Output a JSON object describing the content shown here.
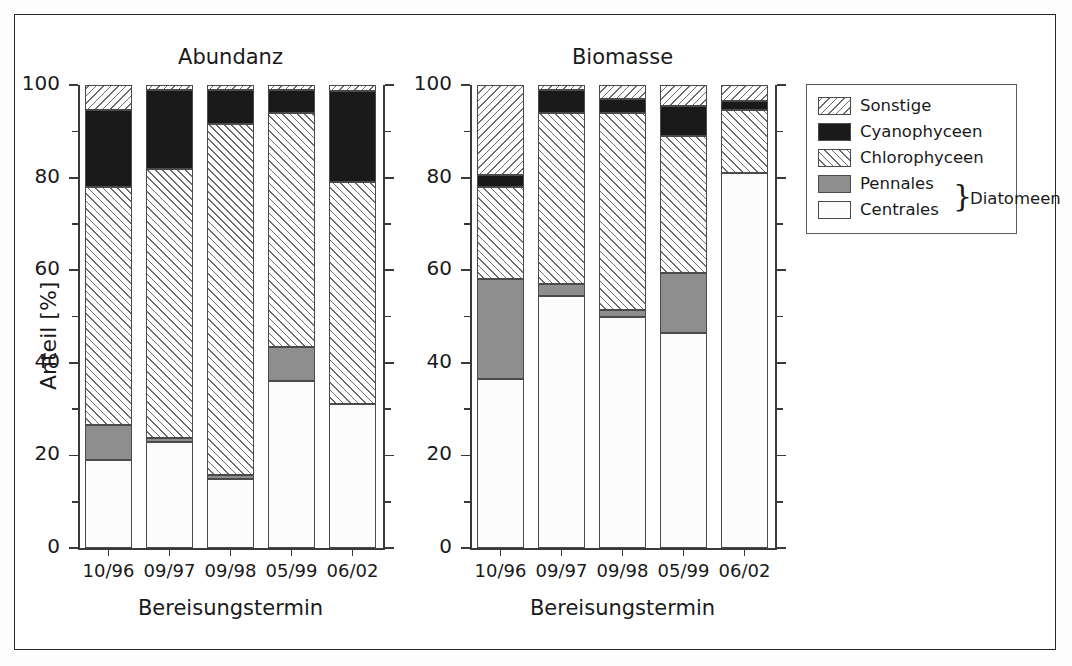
{
  "figure": {
    "width": 1072,
    "height": 666
  },
  "legend": {
    "name": "series-legend",
    "items": [
      {
        "label": "Sonstige",
        "key": "sonstige",
        "pattern": "backslash-hatch",
        "color": "#ffffff"
      },
      {
        "label": "Cyanophyceen",
        "key": "cyano",
        "pattern": "solid",
        "color": "#1a1a1a"
      },
      {
        "label": "Chlorophyceen",
        "key": "chloro",
        "pattern": "forwardslash-hatch",
        "color": "#ffffff"
      },
      {
        "label": "Pennales",
        "key": "pennales",
        "pattern": "solid",
        "color": "#8e8e8e"
      },
      {
        "label": "Centrales",
        "key": "centrales",
        "pattern": "solid",
        "color": "#fcfcfc"
      }
    ],
    "group_label": "Diatomeen",
    "group_brace": "}",
    "group_members": [
      "Pennales",
      "Centrales"
    ]
  },
  "axes": {
    "ylabel": "Anteil [%]",
    "yticks": [
      0,
      20,
      40,
      60,
      80,
      100
    ],
    "ytick_labels": [
      "0",
      "20",
      "40",
      "60",
      "80",
      "100"
    ],
    "yminor_step": 10,
    "ylim": [
      0,
      100
    ],
    "xlabel": "Bereisungstermin"
  },
  "chart_data": [
    {
      "type": "bar",
      "title": "Abundanz",
      "subtitle": "",
      "stacked": true,
      "xlabel": "Bereisungstermin",
      "ylabel": "Anteil [%]",
      "ylim": [
        0,
        100
      ],
      "yticks": [
        0,
        20,
        40,
        60,
        80,
        100
      ],
      "grid": false,
      "legend_position": "right-outside",
      "categories": [
        "10/96",
        "09/97",
        "09/98",
        "05/99",
        "06/02"
      ],
      "series": [
        {
          "name": "Centrales",
          "values": [
            19.0,
            23.0,
            14.8,
            36.0,
            31.0
          ]
        },
        {
          "name": "Pennales",
          "values": [
            7.5,
            0.8,
            0.9,
            7.5,
            0.0
          ]
        },
        {
          "name": "Chlorophyceen",
          "values": [
            51.5,
            58.0,
            75.8,
            50.5,
            48.0
          ]
        },
        {
          "name": "Cyanophyceen",
          "values": [
            16.5,
            17.2,
            7.5,
            5.0,
            19.8
          ]
        },
        {
          "name": "Sonstige",
          "values": [
            5.5,
            1.0,
            1.0,
            1.0,
            1.2
          ]
        }
      ]
    },
    {
      "type": "bar",
      "title": "Biomasse",
      "subtitle": "",
      "stacked": true,
      "xlabel": "Bereisungstermin",
      "ylabel": "Anteil [%]",
      "ylim": [
        0,
        100
      ],
      "yticks": [
        0,
        20,
        40,
        60,
        80,
        100
      ],
      "grid": false,
      "legend_position": "right-outside",
      "categories": [
        "10/96",
        "09/97",
        "09/98",
        "05/99",
        "06/02"
      ],
      "series": [
        {
          "name": "Centrales",
          "values": [
            36.5,
            54.5,
            50.0,
            46.5,
            81.0
          ]
        },
        {
          "name": "Pennales",
          "values": [
            21.5,
            2.5,
            1.5,
            13.0,
            0.0
          ]
        },
        {
          "name": "Chlorophyceen",
          "values": [
            20.0,
            37.0,
            42.5,
            29.5,
            13.5
          ]
        },
        {
          "name": "Cyanophyceen",
          "values": [
            2.5,
            5.0,
            3.0,
            6.5,
            2.0
          ]
        },
        {
          "name": "Sonstige",
          "values": [
            19.5,
            1.0,
            3.0,
            4.5,
            3.5
          ]
        }
      ]
    }
  ]
}
